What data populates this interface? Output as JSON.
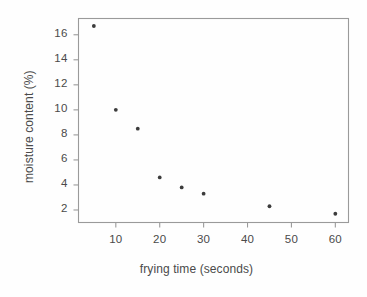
{
  "chart_data": {
    "type": "scatter",
    "title": "",
    "xlabel": "frying time (seconds)",
    "ylabel": "moisture content (%)",
    "x": [
      5,
      10,
      15,
      20,
      25,
      30,
      45,
      60
    ],
    "values": [
      16.7,
      10.0,
      8.5,
      4.6,
      3.8,
      3.3,
      2.3,
      1.7
    ],
    "series": [
      {
        "name": "moisture content",
        "points": [
          {
            "x": 5,
            "y": 16.7
          },
          {
            "x": 10,
            "y": 10.0
          },
          {
            "x": 15,
            "y": 8.5
          },
          {
            "x": 20,
            "y": 4.6
          },
          {
            "x": 25,
            "y": 3.8
          },
          {
            "x": 30,
            "y": 3.3
          },
          {
            "x": 45,
            "y": 2.3
          },
          {
            "x": 60,
            "y": 1.7
          }
        ]
      }
    ],
    "xlim": [
      1.5,
      63.0
    ],
    "ylim": [
      1.0,
      17.3
    ],
    "xticks": [
      10,
      20,
      30,
      40,
      50,
      60
    ],
    "yticks": [
      2,
      4,
      6,
      8,
      10,
      12,
      14,
      16
    ],
    "xtick_labels": [
      "10",
      "20",
      "30",
      "40",
      "50",
      "60"
    ],
    "ytick_labels": [
      "2",
      "4",
      "6",
      "8",
      "10",
      "12",
      "14",
      "16"
    ],
    "grid": false,
    "legend": null,
    "marker": "dot",
    "marker_color": "#3c3c3c",
    "frame_color": "#9a9a9a",
    "text_color": "#4a4a4a",
    "background_color": "#fefefe"
  }
}
